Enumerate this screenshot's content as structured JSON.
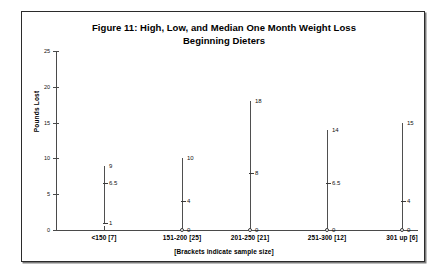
{
  "chart_data": {
    "type": "scatter",
    "title": "Figure 11: High, Low, and Median One Month Weight Loss",
    "subtitle": "Beginning Dieters",
    "title_line1": "Figure 11: High, Low, and Median One Month Weight Loss",
    "title_line2": "Beginning Dieters",
    "xlabel": "",
    "ylabel": "Pounds Lost",
    "ylim": [
      0,
      25
    ],
    "yticks": [
      0,
      5,
      10,
      15,
      20,
      25
    ],
    "ytick_labels": [
      "0",
      "5",
      "10",
      "15",
      "20",
      "25"
    ],
    "grid": false,
    "legend": "none",
    "footnote": "[Brackets indicate sample size]",
    "categories": [
      "<150 [7]",
      "151-200 [25]",
      "201-250 [21]",
      "251-300 [12]",
      "301 up [6]"
    ],
    "sample_sizes": [
      7,
      25,
      21,
      12,
      6
    ],
    "series": [
      {
        "name": "High",
        "values": [
          9,
          10,
          18,
          14,
          15
        ]
      },
      {
        "name": "Median",
        "values": [
          6.5,
          4,
          8,
          6.5,
          4
        ]
      },
      {
        "name": "Low",
        "values": [
          1,
          0,
          0,
          0,
          0
        ]
      }
    ],
    "groups": [
      {
        "category": "<150 [7]",
        "high": 9,
        "high_label": "9",
        "median": 6.5,
        "median_label": "6.5",
        "low": 1,
        "low_label": "1",
        "low_marker": "tick"
      },
      {
        "category": "151-200 [25]",
        "high": 10,
        "high_label": "10",
        "median": 4,
        "median_label": "4",
        "low": 0,
        "low_label": "0",
        "low_marker": "circle"
      },
      {
        "category": "201-250 [21]",
        "high": 18,
        "high_label": "18",
        "median": 8,
        "median_label": "8",
        "low": 0,
        "low_label": "0",
        "low_marker": "circle"
      },
      {
        "category": "251-300 [12]",
        "high": 14,
        "high_label": "14",
        "median": 6.5,
        "median_label": "6.5",
        "low": 0,
        "low_label": "0",
        "low_marker": "circle"
      },
      {
        "category": "301 up [6]",
        "high": 15,
        "high_label": "15",
        "median": 4,
        "median_label": "4",
        "low": 0,
        "low_label": "0",
        "low_marker": "circle"
      }
    ],
    "colors": {
      "background": "#ffffff",
      "axis": "#4a4a4a",
      "series": "#4f4f4f",
      "text": "#111111",
      "frame": "#2b2b2b"
    }
  }
}
